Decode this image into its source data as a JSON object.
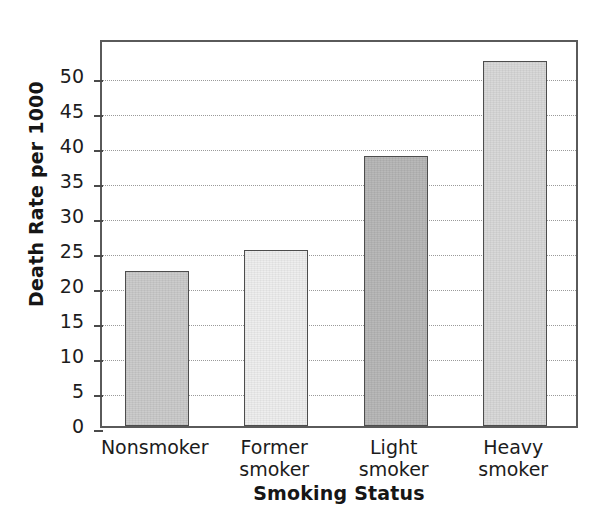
{
  "chart_data": {
    "type": "bar",
    "title": "",
    "xlabel": "Smoking Status",
    "ylabel": "Death Rate per 1000",
    "categories": [
      "Nonsmoker",
      "Former smoker",
      "Light smoker",
      "Heavy smoker"
    ],
    "category_lines": [
      [
        "Nonsmoker"
      ],
      [
        "Former",
        "smoker"
      ],
      [
        "Light",
        "smoker"
      ],
      [
        "Heavy",
        "smoker"
      ]
    ],
    "values": [
      22.2,
      25.2,
      38.6,
      52.2
    ],
    "ylim": [
      0,
      55.5
    ],
    "yticks": [
      0,
      5,
      10,
      15,
      20,
      25,
      30,
      35,
      40,
      45,
      50
    ],
    "ytick_labels": [
      "0",
      "5",
      "10",
      "15",
      "20",
      "25",
      "30",
      "35",
      "40",
      "45",
      "50"
    ],
    "grid": "horizontal-dotted",
    "legend": "none",
    "bar_colors": [
      "#c9c9c9",
      "#ededed",
      "#b5b5b5",
      "#d7d7d7"
    ],
    "bar_edge_color": "#4d4d4d",
    "axis_color": "#5a5a5a",
    "grid_color": "#9a9a9a",
    "background": "#ffffff"
  }
}
